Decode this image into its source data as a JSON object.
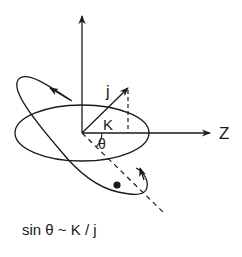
{
  "diagram": {
    "labels": {
      "j": "j",
      "K": "K",
      "theta": "θ",
      "Z": "Z"
    },
    "formula": "sin θ ~ K / j",
    "colors": {
      "stroke": "#1a1a1a",
      "background": "#ffffff"
    }
  }
}
